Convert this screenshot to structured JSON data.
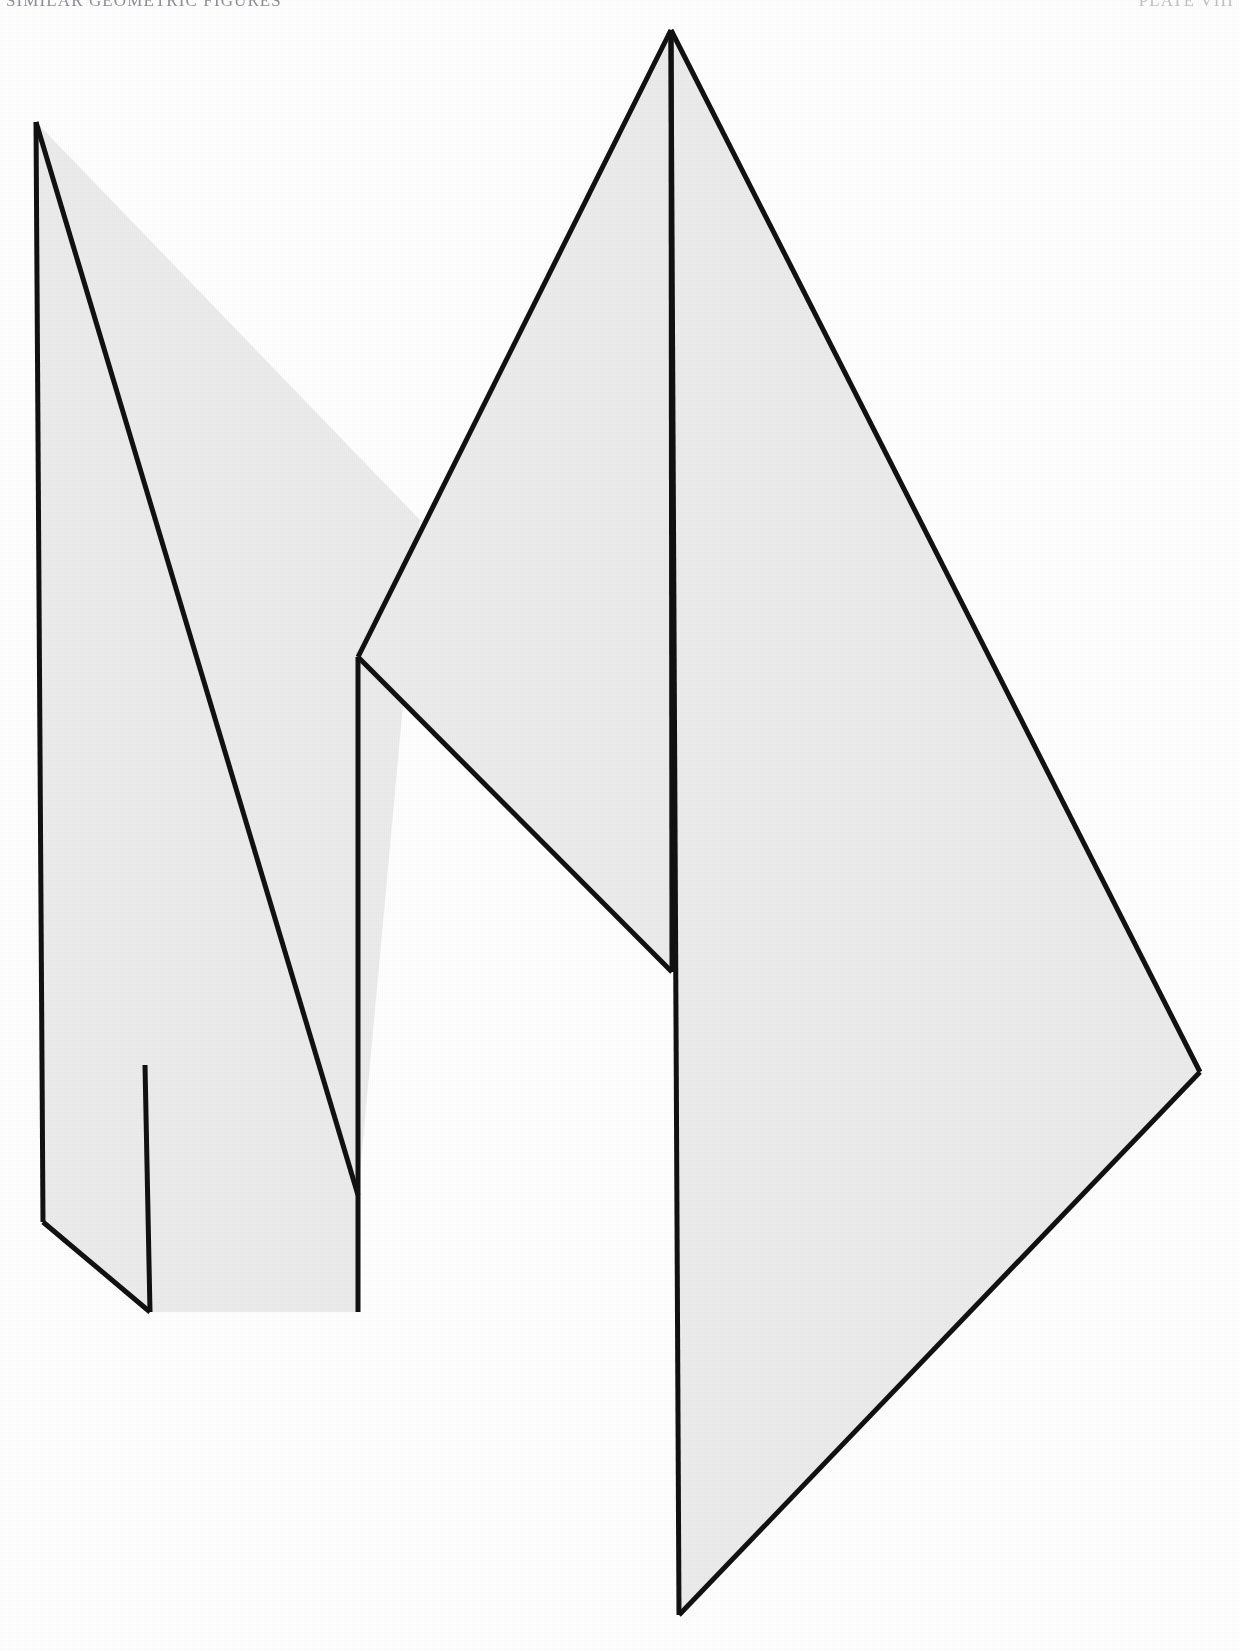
{
  "page": {
    "background_color": "#ffffff",
    "width": 1240,
    "height": 1651
  },
  "running_head": {
    "left_text": "SIMILAR GEOMETRIC FIGURES",
    "right_text": "PLATE VIII",
    "color": "#70707a"
  },
  "figure": {
    "name": "overlapping-triangles-figure",
    "stroke_color": "#111111",
    "fill_color": "#ebebeb",
    "stroke_width": 5,
    "shapes": [
      {
        "id": "shape-left-triangle",
        "label": "Left triangle",
        "fill": "#ececec",
        "stroke": "#111111",
        "points": "36,122 420,520 358,1195 358,1312 150,1312 43,1222"
      },
      {
        "id": "shape-middle-triangle",
        "label": "Middle triangle",
        "fill": "#ececec",
        "stroke": "#111111",
        "points": "671,30 672,972 358,657"
      },
      {
        "id": "shape-right-triangle",
        "label": "Right triangle",
        "fill": "#ececec",
        "stroke": "#111111",
        "points": "671,30 1200,1072 679,1615"
      }
    ],
    "edges": [
      {
        "id": "edge-left-vertical",
        "from": "36,122",
        "to": "43,1222"
      },
      {
        "id": "edge-left-hypotenuse",
        "from": "36,122",
        "to": "358,1195"
      },
      {
        "id": "edge-left-bottom-diagonal",
        "from": "43,1222",
        "to": "150,1312"
      },
      {
        "id": "edge-inner-vertical-short",
        "from": "145,1065",
        "to": "150,1312"
      },
      {
        "id": "edge-mid-left",
        "from": "671,30",
        "to": "358,657"
      },
      {
        "id": "edge-mid-lower",
        "from": "358,657",
        "to": "672,972"
      },
      {
        "id": "edge-mid-vertical",
        "from": "671,30",
        "to": "672,972"
      },
      {
        "id": "edge-inner-vertical-long",
        "from": "358,657",
        "to": "358,1312"
      },
      {
        "id": "edge-right-upper",
        "from": "671,30",
        "to": "1200,1072"
      },
      {
        "id": "edge-right-lower",
        "from": "1200,1072",
        "to": "679,1615"
      },
      {
        "id": "edge-right-vertical",
        "from": "671,30",
        "to": "679,1615"
      }
    ],
    "vertices": [
      {
        "id": "vertex-left-apex",
        "x": 36,
        "y": 122
      },
      {
        "id": "vertex-left-bottom",
        "x": 43,
        "y": 1222
      },
      {
        "id": "vertex-top-apex",
        "x": 671,
        "y": 30
      },
      {
        "id": "vertex-crossing-upper",
        "x": 420,
        "y": 520
      },
      {
        "id": "vertex-junction-middle",
        "x": 358,
        "y": 657
      },
      {
        "id": "vertex-junction-lower",
        "x": 145,
        "y": 1065
      },
      {
        "id": "vertex-mid-bottom-right",
        "x": 672,
        "y": 972
      },
      {
        "id": "vertex-right-corner",
        "x": 1200,
        "y": 1072
      },
      {
        "id": "vertex-bottom-tip",
        "x": 679,
        "y": 1615
      },
      {
        "id": "vertex-tail-bottom",
        "x": 150,
        "y": 1312
      },
      {
        "id": "vertex-tail-inner",
        "x": 358,
        "y": 1195
      }
    ]
  }
}
